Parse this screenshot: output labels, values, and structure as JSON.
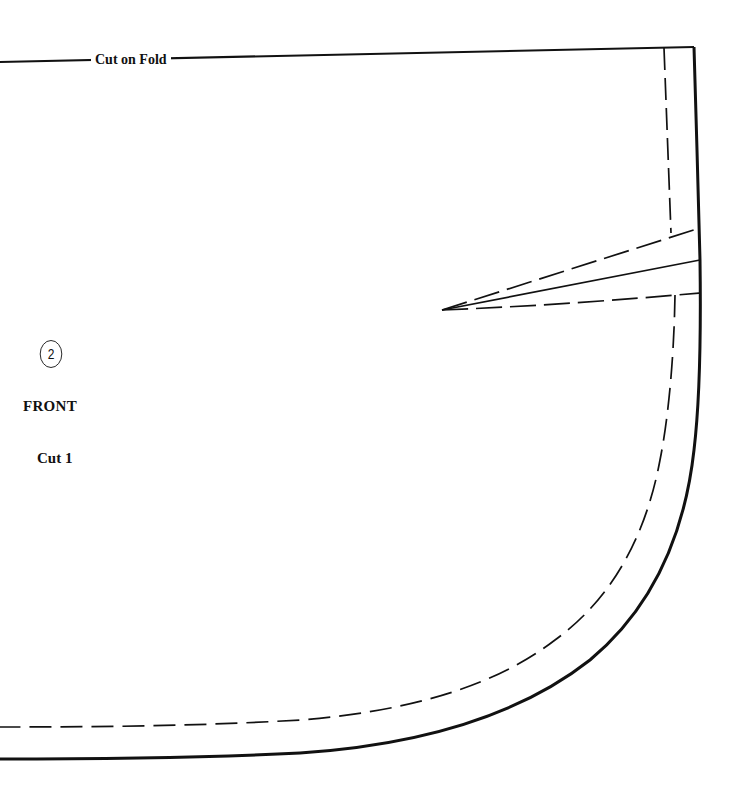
{
  "pattern": {
    "fold_label": "Cut on Fold",
    "piece_number": "2",
    "piece_name": "FRONT",
    "cut_instruction": "Cut 1"
  },
  "lines": {
    "cutting_line": "solid",
    "seam_line": "dashed",
    "dart": "solid center line with dashed legs"
  },
  "colors": {
    "line": "#111111",
    "background": "#ffffff"
  }
}
